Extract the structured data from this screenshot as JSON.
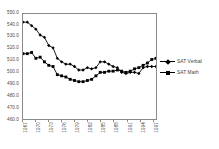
{
  "chart_data": {
    "type": "line",
    "title": "",
    "xlabel": "",
    "ylabel": "",
    "ylim": [
      460,
      550
    ],
    "ytick_step": 10,
    "yticks": [
      550,
      540,
      530,
      520,
      510,
      500,
      490,
      480,
      470,
      460
    ],
    "grid": false,
    "legend_position": "right",
    "x": [
      1967,
      1968,
      1969,
      1970,
      1971,
      1972,
      1973,
      1974,
      1975,
      1976,
      1977,
      1978,
      1979,
      1980,
      1981,
      1982,
      1983,
      1984,
      1985,
      1986,
      1987,
      1988,
      1989,
      1990,
      1991,
      1992,
      1993,
      1994,
      1995,
      1996,
      1997,
      1998
    ],
    "xtick_labels": [
      "1967",
      "1970",
      "1973",
      "1976",
      "1979",
      "1982",
      "1985",
      "1988",
      "1991",
      "1994",
      "1997"
    ],
    "xtick_values": [
      1967,
      1970,
      1973,
      1976,
      1979,
      1982,
      1985,
      1988,
      1991,
      1994,
      1997
    ],
    "series": [
      {
        "name": "SAT Verbal",
        "marker": "diamond",
        "color": "#000000",
        "values": [
          543,
          543,
          540,
          537,
          532,
          530,
          523,
          521,
          512,
          509,
          507,
          507,
          505,
          502,
          502,
          504,
          503,
          504,
          509,
          509,
          507,
          505,
          504,
          500,
          499,
          500,
          500,
          499,
          504,
          505,
          505,
          505
        ]
      },
      {
        "name": "SAT Math",
        "marker": "square",
        "color": "#000000",
        "values": [
          516,
          516,
          517,
          512,
          513,
          509,
          506,
          505,
          498,
          497,
          496,
          494,
          493,
          492,
          492,
          493,
          494,
          497,
          500,
          500,
          501,
          501,
          502,
          501,
          500,
          501,
          503,
          504,
          506,
          508,
          511,
          512
        ]
      }
    ]
  },
  "legend": {
    "items": [
      {
        "label": "SAT Verbal",
        "marker": "diamond"
      },
      {
        "label": "SAT Math",
        "marker": "square"
      }
    ]
  }
}
